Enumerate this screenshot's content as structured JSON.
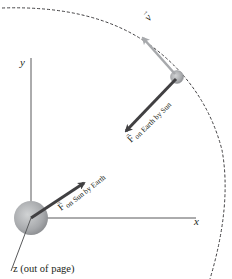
{
  "diagram": {
    "axes": {
      "x_label": "x",
      "y_label": "y",
      "z_label": "z (out of page)"
    },
    "vectors": {
      "velocity": {
        "symbol": "v",
        "color": "#a7a9ac"
      },
      "force_on_earth": {
        "symbol": "F",
        "subscript": "on Earth by Sun",
        "color": "#414042"
      },
      "force_on_sun": {
        "symbol": "F",
        "subscript": "on Sun by Earth",
        "color": "#414042"
      }
    },
    "bodies": {
      "sun": {
        "name": "Sun",
        "color": "#a7a9ac"
      },
      "earth": {
        "name": "Earth",
        "color": "#a7a9ac"
      }
    },
    "orbit": {
      "style": "dashed",
      "color": "#414042"
    },
    "colors": {
      "axis": "#414042",
      "text": "#231f20",
      "background": "#ffffff"
    }
  }
}
